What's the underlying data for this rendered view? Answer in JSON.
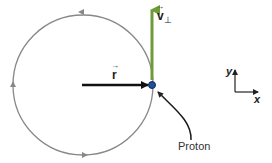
{
  "diagram": {
    "title": "",
    "colors": {
      "circle": "#888888",
      "velocity_arrow": "#6f9a3a",
      "radius_arrow": "#111111",
      "proton": "#1f4f9a",
      "pointer": "#1a1a1a",
      "axes": "#222222"
    },
    "labels": {
      "velocity": "v",
      "velocity_subscript": "⊥",
      "radius": "r",
      "particle": "Proton",
      "axis_y": "y",
      "axis_x": "x"
    },
    "circle": {
      "cx": 83,
      "cy": 85,
      "r": 70,
      "direction_markers": 4,
      "motion": "counterclockwise"
    },
    "proton_position": {
      "x": 152,
      "y": 85
    }
  }
}
